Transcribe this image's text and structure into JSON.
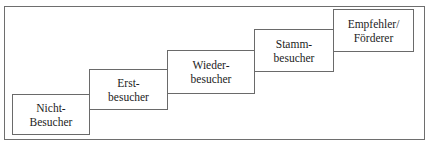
{
  "diagram": {
    "clipped_top_caption": "",
    "frame": {
      "label": "outer-frame"
    },
    "steps": [
      {
        "id": "nicht-besucher",
        "line1": "Nicht-",
        "line2": "Besucher",
        "x": 12,
        "y": 94,
        "w": 78,
        "h": 41
      },
      {
        "id": "erst-besucher",
        "line1": "Erst-",
        "line2": "besucher",
        "x": 89,
        "y": 69,
        "w": 79,
        "h": 41
      },
      {
        "id": "wieder-besucher",
        "line1": "Wieder-",
        "line2": "besucher",
        "x": 167,
        "y": 50,
        "w": 88,
        "h": 44
      },
      {
        "id": "stamm-besucher",
        "line1": "Stamm-",
        "line2": "besucher",
        "x": 254,
        "y": 29,
        "w": 80,
        "h": 43
      },
      {
        "id": "empfehler-foerderer",
        "line1": "Empfehler/",
        "line2": "Förderer",
        "x": 333,
        "y": 9,
        "w": 81,
        "h": 43
      }
    ]
  },
  "colors": {
    "box_border": "#6a6a6a",
    "frame_border": "#6e6e6e",
    "background": "#ffffff",
    "text": "#1c1c1c"
  }
}
